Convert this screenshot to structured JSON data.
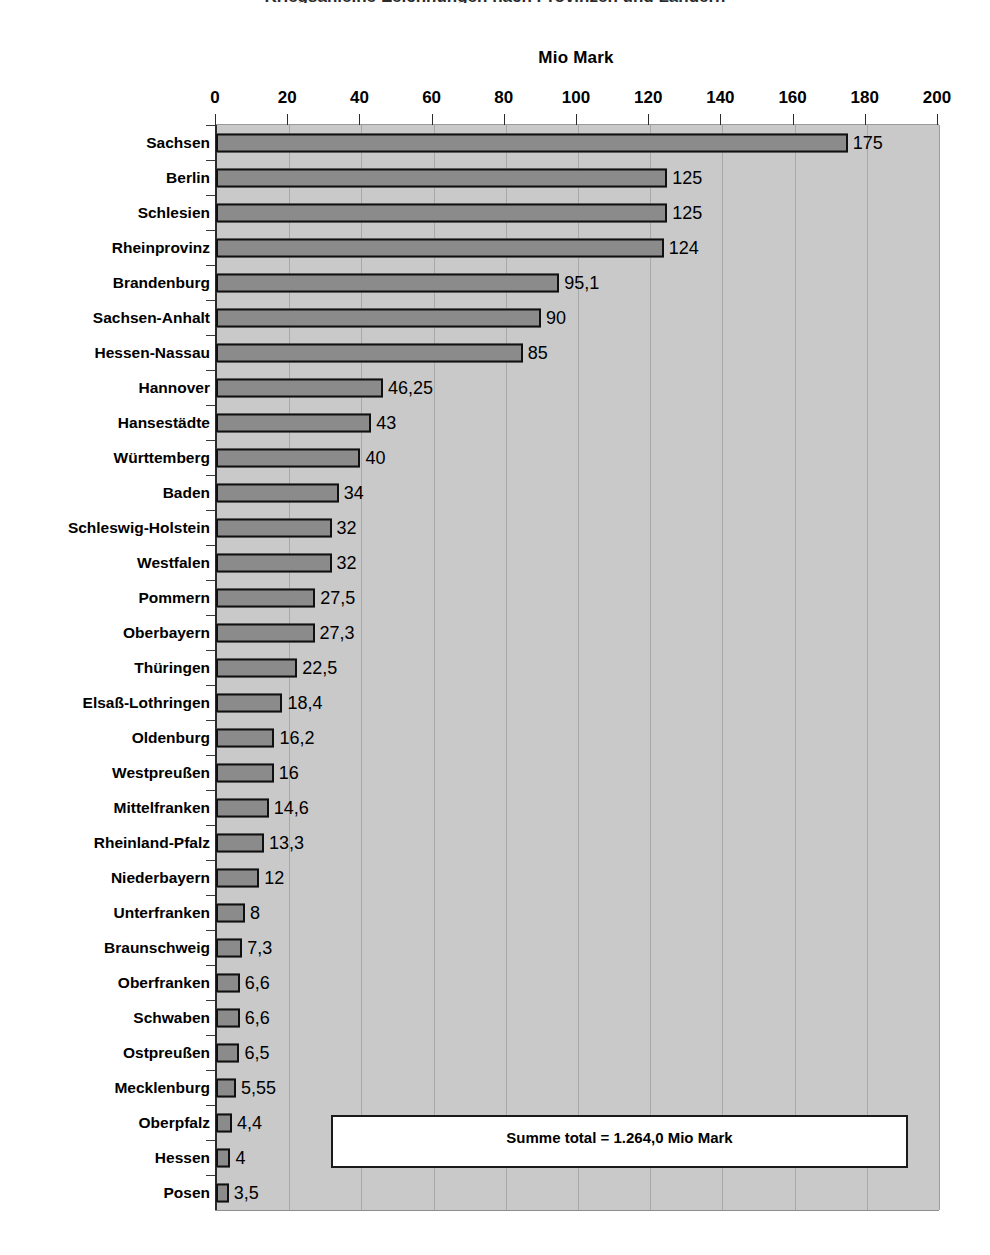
{
  "page": {
    "cut_off_title": "Kriegsanleihe-Zeichnungen nach Provinzen und Ländern",
    "background_color": "#ffffff"
  },
  "colors": {
    "plot_background": "#c9c9c9",
    "bar_fill": "#8b8b8b",
    "bar_border": "#101010",
    "gridline": "#a8a8a8",
    "axis_line": "#2a2a2a",
    "text": "#000000",
    "summe_box_background": "#ffffff"
  },
  "chart_data": {
    "type": "bar",
    "orientation": "horizontal",
    "title": "",
    "xlabel": "Mio Mark",
    "ylabel": "",
    "xlim": [
      0,
      200
    ],
    "xticks": [
      0,
      20,
      40,
      60,
      80,
      100,
      120,
      140,
      160,
      180,
      200
    ],
    "xtick_labels": [
      "0",
      "20",
      "40",
      "60",
      "80",
      "100",
      "120",
      "140",
      "160",
      "180",
      "200"
    ],
    "grid": true,
    "legend": false,
    "categories": [
      "Sachsen",
      "Berlin",
      "Schlesien",
      "Rheinprovinz",
      "Brandenburg",
      "Sachsen-Anhalt",
      "Hessen-Nassau",
      "Hannover",
      "Hansestädte",
      "Württemberg",
      "Baden",
      "Schleswig-Holstein",
      "Westfalen",
      "Pommern",
      "Oberbayern",
      "Thüringen",
      "Elsaß-Lothringen",
      "Oldenburg",
      "Westpreußen",
      "Mittelfranken",
      "Rheinland-Pfalz",
      "Niederbayern",
      "Unterfranken",
      "Braunschweig",
      "Oberfranken",
      "Schwaben",
      "Ostpreußen",
      "Mecklenburg",
      "Oberpfalz",
      "Hessen",
      "Posen"
    ],
    "values": [
      175,
      125,
      125,
      124,
      95.1,
      90,
      85,
      46.25,
      43,
      40,
      34,
      32,
      32,
      27.5,
      27.3,
      22.5,
      18.4,
      16.2,
      16,
      14.6,
      13.3,
      12,
      8,
      7.3,
      6.6,
      6.6,
      6.5,
      5.55,
      4.4,
      4,
      3.5
    ],
    "value_labels": [
      "175",
      "125",
      "125",
      "124",
      "95,1",
      "90",
      "85",
      "46,25",
      "43",
      "40",
      "34",
      "32",
      "32",
      "27,5",
      "27,3",
      "22,5",
      "18,4",
      "16,2",
      "16",
      "14,6",
      "13,3",
      "12",
      "8",
      "7,3",
      "6,6",
      "6,6",
      "6,5",
      "5,55",
      "4,4",
      "4",
      "3,5"
    ],
    "annotations": [
      {
        "name": "summe-total",
        "text": "Summe total = 1.264,0 Mio Mark",
        "value": 1264.0,
        "unit": "Mio Mark"
      }
    ]
  }
}
